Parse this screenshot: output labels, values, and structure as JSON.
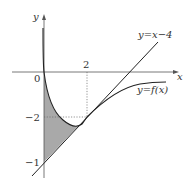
{
  "figure": {
    "axes": {
      "x_label": "x",
      "y_label": "y",
      "origin_label": "0"
    },
    "ticks": {
      "x_tick": "2",
      "y_tick_1": "−2",
      "y_tick_2": "−1"
    },
    "line_label": "y=x−4",
    "curve_label": "y=f(x)",
    "colors": {
      "stroke": "#222222",
      "shade": "#a9a9a9",
      "guide": "#555555"
    }
  }
}
